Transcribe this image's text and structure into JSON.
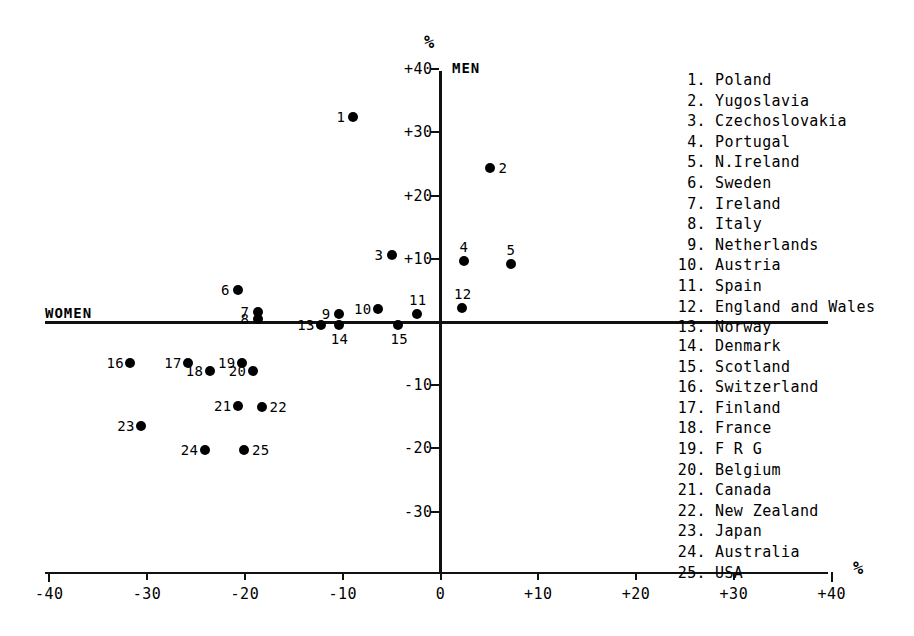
{
  "chart_data": {
    "type": "scatter",
    "title": "",
    "xlabel": "%",
    "ylabel": "%",
    "quadrant_labels": {
      "left": "WOMEN",
      "right": "MEN"
    },
    "xlim": [
      -40,
      40
    ],
    "ylim": [
      -40,
      40
    ],
    "grid": false,
    "legend_position": "right",
    "x_ticks": [
      "-40",
      "-30",
      "-20",
      "-10",
      "0",
      "+10",
      "+20",
      "+30",
      "+40"
    ],
    "x_tick_values": [
      -40,
      -30,
      -20,
      -10,
      0,
      10,
      20,
      30,
      40
    ],
    "y_ticks": [
      "+40",
      "+30",
      "+20",
      "+10",
      "-10",
      "-20",
      "-30"
    ],
    "y_tick_values": [
      40,
      30,
      20,
      10,
      -10,
      -20,
      -30
    ],
    "points": [
      {
        "id": "1",
        "name": "Poland",
        "x": -8.9,
        "y": 32.5,
        "label_pos": "left"
      },
      {
        "id": "2",
        "name": "Yugoslavia",
        "x": 5.1,
        "y": 24.3,
        "label_pos": "right"
      },
      {
        "id": "3",
        "name": "Czechoslovakia",
        "x": -5.0,
        "y": 10.6,
        "label_pos": "left"
      },
      {
        "id": "4",
        "name": "Portugal",
        "x": 2.4,
        "y": 9.7,
        "label_pos": "above"
      },
      {
        "id": "5",
        "name": "N.Ireland",
        "x": 7.2,
        "y": 9.1,
        "label_pos": "above"
      },
      {
        "id": "6",
        "name": "Sweden",
        "x": -20.7,
        "y": 5.1,
        "label_pos": "left"
      },
      {
        "id": "7",
        "name": "Ireland",
        "x": -18.7,
        "y": 1.6,
        "label_pos": "left"
      },
      {
        "id": "8",
        "name": "Italy",
        "x": -18.7,
        "y": 0.5,
        "label_pos": "left"
      },
      {
        "id": "9",
        "name": "Netherlands",
        "x": -10.4,
        "y": 1.3,
        "label_pos": "left"
      },
      {
        "id": "10",
        "name": "Austria",
        "x": -6.4,
        "y": 2.0,
        "label_pos": "left"
      },
      {
        "id": "11",
        "name": "Spain",
        "x": -2.4,
        "y": 1.2,
        "label_pos": "above"
      },
      {
        "id": "12",
        "name": "England and Wales",
        "x": 2.2,
        "y": 2.2,
        "label_pos": "above"
      },
      {
        "id": "13",
        "name": "Norway",
        "x": -12.2,
        "y": -0.4,
        "label_pos": "left"
      },
      {
        "id": "14",
        "name": "Denmark",
        "x": -10.4,
        "y": -0.4,
        "label_pos": "below"
      },
      {
        "id": "15",
        "name": "Scotland",
        "x": -4.3,
        "y": -0.4,
        "label_pos": "below"
      },
      {
        "id": "16",
        "name": "Switzerland",
        "x": -31.7,
        "y": -6.5,
        "label_pos": "left"
      },
      {
        "id": "17",
        "name": "Finland",
        "x": -25.8,
        "y": -6.5,
        "label_pos": "left"
      },
      {
        "id": "18",
        "name": "France",
        "x": -23.6,
        "y": -7.8,
        "label_pos": "left"
      },
      {
        "id": "19",
        "name": "FRG",
        "x": -20.3,
        "y": -6.5,
        "label_pos": "left"
      },
      {
        "id": "20",
        "name": "Belgium",
        "x": -19.2,
        "y": -7.7,
        "label_pos": "left"
      },
      {
        "id": "21",
        "name": "Canada",
        "x": -20.7,
        "y": -13.3,
        "label_pos": "left"
      },
      {
        "id": "22",
        "name": "New Zealand",
        "x": -18.3,
        "y": -13.4,
        "label_pos": "right"
      },
      {
        "id": "23",
        "name": "Japan",
        "x": -30.6,
        "y": -16.4,
        "label_pos": "left"
      },
      {
        "id": "24",
        "name": "Australia",
        "x": -24.1,
        "y": -20.2,
        "label_pos": "left"
      },
      {
        "id": "25",
        "name": "USA",
        "x": -20.1,
        "y": -20.2,
        "label_pos": "right"
      }
    ]
  },
  "legend": {
    "top": [
      {
        "num": "1.",
        "name": "Poland"
      },
      {
        "num": "2.",
        "name": "Yugoslavia"
      },
      {
        "num": "3.",
        "name": "Czechoslovakia"
      },
      {
        "num": "4.",
        "name": "Portugal"
      },
      {
        "num": "5.",
        "name": "N.Ireland"
      },
      {
        "num": "6.",
        "name": "Sweden"
      },
      {
        "num": "7.",
        "name": "Ireland"
      },
      {
        "num": "8.",
        "name": "Italy"
      },
      {
        "num": "9.",
        "name": "Netherlands"
      },
      {
        "num": "10.",
        "name": "Austria"
      },
      {
        "num": "11.",
        "name": "Spain"
      },
      {
        "num": "12.",
        "name": "England and Wales"
      },
      {
        "num": "13.",
        "name": "Norway"
      }
    ],
    "bottom": [
      {
        "num": "14.",
        "name": "Denmark"
      },
      {
        "num": "15.",
        "name": "Scotland"
      },
      {
        "num": "16.",
        "name": "Switzerland"
      },
      {
        "num": "17.",
        "name": "Finland"
      },
      {
        "num": "18.",
        "name": "France"
      },
      {
        "num": "19.",
        "name": "F R G"
      },
      {
        "num": "20.",
        "name": "Belgium"
      },
      {
        "num": "21.",
        "name": "Canada"
      },
      {
        "num": "22.",
        "name": "New Zealand"
      },
      {
        "num": "23.",
        "name": "Japan"
      },
      {
        "num": "24.",
        "name": "Australia"
      },
      {
        "num": "25.",
        "name": "USA"
      }
    ]
  },
  "colors": {
    "axis": "#111111",
    "point": "#000000",
    "text": "#000000",
    "background": "#ffffff"
  }
}
